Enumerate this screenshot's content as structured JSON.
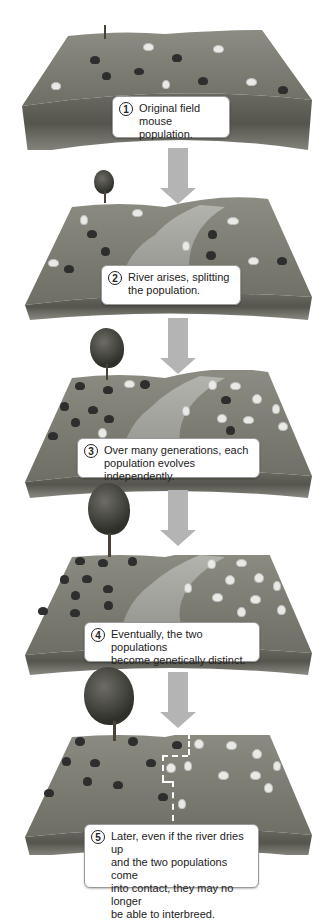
{
  "figure": {
    "steps": [
      {
        "number": "1",
        "text_line1": "Original field",
        "text_line2": "mouse population.",
        "text_line3": "",
        "text_line4": "",
        "river": false,
        "tree": "sapling"
      },
      {
        "number": "2",
        "text_line1": "River arises, splitting",
        "text_line2": "the population.",
        "text_line3": "",
        "text_line4": "",
        "river": true,
        "tree": "small"
      },
      {
        "number": "3",
        "text_line1": "Over many generations, each",
        "text_line2": "population evolves independently.",
        "text_line3": "",
        "text_line4": "",
        "river": true,
        "tree": "medium"
      },
      {
        "number": "4",
        "text_line1": "Eventually, the two populations",
        "text_line2": "become genetically distinct.",
        "text_line3": "",
        "text_line4": "",
        "river": true,
        "tree": "large"
      },
      {
        "number": "5",
        "text_line1": "Later, even if the river dries up",
        "text_line2": "and the two populations come",
        "text_line3": "into contact, they may no longer",
        "text_line4": "be able to interbreed.",
        "river": false,
        "tree": "largest"
      }
    ],
    "colors": {
      "arrow": "#b4b4b4",
      "grass": "#7c7c72",
      "soil": "#5a5a52",
      "river": "#9b9b96",
      "label_bg": "#ffffff",
      "label_border": "#9a9a9a",
      "dark_mouse": "#2e2e2e",
      "light_mouse": "#e9e9e6"
    }
  }
}
